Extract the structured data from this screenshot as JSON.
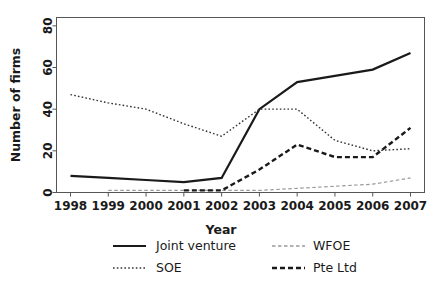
{
  "chart_data": {
    "type": "line",
    "title": "",
    "xlabel": "Year",
    "ylabel": "Number of firms",
    "categories": [
      1998,
      1999,
      2000,
      2001,
      2002,
      2003,
      2004,
      2005,
      2006,
      2007
    ],
    "x_tick_labels": [
      "1998",
      "1999",
      "2000",
      "2001",
      "2002",
      "2003",
      "2004",
      "2005",
      "2006",
      "2007"
    ],
    "y_tick_labels": [
      "0",
      "20",
      "40",
      "60",
      "80"
    ],
    "y_ticks": [
      0,
      20,
      40,
      60,
      80
    ],
    "ylim": [
      0,
      84
    ],
    "xlim": [
      1997.6,
      2007.4
    ],
    "grid": false,
    "legend_position": "bottom",
    "series": [
      {
        "name": "Joint venture",
        "style": "solid",
        "color": "#1a1a1a",
        "width": 2.2,
        "values": [
          8,
          7,
          6,
          5,
          7,
          40,
          53,
          56,
          59,
          67
        ]
      },
      {
        "name": "SOE",
        "style": "dotted",
        "color": "#333333",
        "width": 1.4,
        "values": [
          47,
          43,
          40,
          33,
          27,
          40,
          40,
          25,
          20,
          21
        ]
      },
      {
        "name": "WFOE",
        "style": "fine-dashed",
        "color": "#9a9a9a",
        "width": 1.2,
        "values": [
          null,
          1,
          1,
          1,
          1,
          1,
          2,
          3,
          4,
          7
        ]
      },
      {
        "name": "Pte Ltd",
        "style": "dashed",
        "color": "#1a1a1a",
        "width": 2.4,
        "values": [
          null,
          null,
          null,
          1,
          1,
          11,
          23,
          17,
          17,
          31
        ]
      }
    ]
  },
  "legend": {
    "entries": [
      {
        "label": "Joint venture"
      },
      {
        "label": "WFOE"
      },
      {
        "label": "SOE"
      },
      {
        "label": "Pte Ltd"
      }
    ]
  },
  "axes": {
    "x_axis_title": "Year",
    "y_axis_title": "Number of firms"
  }
}
